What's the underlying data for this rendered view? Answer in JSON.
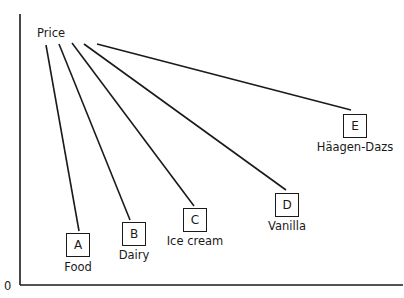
{
  "diagram": {
    "root_label": "Price",
    "origin_label": "0",
    "nodes": [
      {
        "letter": "A",
        "label": "Food"
      },
      {
        "letter": "B",
        "label": "Dairy"
      },
      {
        "letter": "C",
        "label": "Ice cream"
      },
      {
        "letter": "D",
        "label": "Vanilla"
      },
      {
        "letter": "E",
        "label": "Häagen-Dazs"
      }
    ]
  }
}
